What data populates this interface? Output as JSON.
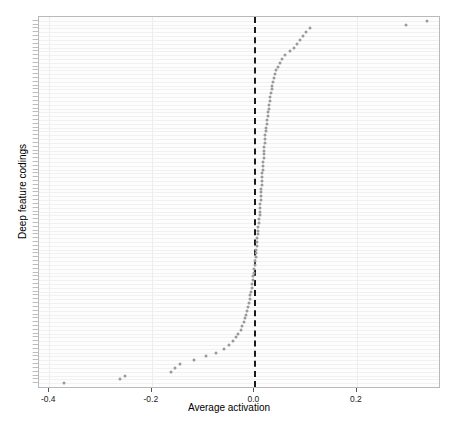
{
  "chart_data": {
    "type": "scatter",
    "title": "",
    "xlabel": "Average activation",
    "ylabel": "Deep feature codings",
    "xlim": [
      -0.42,
      0.36
    ],
    "ylim": [
      0,
      94
    ],
    "grid": true,
    "legend": "none",
    "annotations": [
      {
        "type": "vline",
        "x": 0.0,
        "style": "dashed",
        "color": "#1a1a1a"
      }
    ],
    "xticks": [
      -0.4,
      -0.2,
      0.0,
      0.2
    ],
    "xticklabels": [
      "-0.4",
      "-0.2",
      "0.0",
      "0.2"
    ],
    "marker": {
      "shape": "circle",
      "color": "#9a9a9a",
      "size": 3
    },
    "categories": [
      "C-93",
      "C-92",
      "C-91",
      "C-90",
      "C-89",
      "C-88",
      "C-87",
      "C-86",
      "C-85",
      "C-84",
      "C-83",
      "C-82",
      "C-81",
      "C-80",
      "C-79",
      "C-78",
      "C-77",
      "C-76",
      "C-75",
      "C-74",
      "C-73",
      "C-72",
      "C-71",
      "C-70",
      "C-69",
      "C-68",
      "C-67",
      "C-66",
      "C-65",
      "C-64",
      "C-63",
      "C-62",
      "C-61",
      "C-60",
      "C-59",
      "C-58",
      "C-57",
      "C-56",
      "C-55",
      "C-54",
      "C-53",
      "C-52",
      "C-51",
      "C-50",
      "C-49",
      "C-48",
      "C-47",
      "C-46",
      "C-45",
      "C-44",
      "C-43",
      "C-42",
      "C-41",
      "C-40",
      "C-39",
      "C-38",
      "C-37",
      "C-36",
      "C-35",
      "C-34",
      "C-33",
      "C-32",
      "C-31",
      "C-30",
      "C-29",
      "C-28",
      "C-27",
      "C-26",
      "C-25",
      "C-24",
      "C-23",
      "C-22",
      "C-21",
      "C-20",
      "C-19",
      "C-18",
      "C-17",
      "C-16",
      "C-15",
      "C-14",
      "C-13",
      "C-12",
      "C-11",
      "C-10",
      "C-09",
      "C-08",
      "C-07",
      "C-06",
      "C-05",
      "C-04",
      "C-03",
      "C-02",
      "C-01"
    ],
    "values": [
      0.337,
      0.295,
      0.108,
      0.101,
      0.094,
      0.089,
      0.084,
      0.078,
      0.069,
      0.06,
      0.054,
      0.049,
      0.046,
      0.043,
      0.041,
      0.039,
      0.037,
      0.035,
      0.034,
      0.032,
      0.031,
      0.03,
      0.029,
      0.028,
      0.027,
      0.026,
      0.025,
      0.024,
      0.023,
      0.022,
      0.021,
      0.021,
      0.02,
      0.019,
      0.019,
      0.018,
      0.018,
      0.017,
      0.016,
      0.016,
      0.015,
      0.015,
      0.014,
      0.014,
      0.013,
      0.013,
      0.012,
      0.012,
      0.011,
      0.011,
      0.01,
      0.01,
      0.009,
      0.009,
      0.008,
      0.008,
      0.007,
      0.006,
      0.006,
      0.005,
      0.004,
      0.004,
      0.003,
      0.002,
      0.001,
      0.0,
      -0.001,
      -0.002,
      -0.003,
      -0.004,
      -0.005,
      -0.006,
      -0.008,
      -0.009,
      -0.011,
      -0.013,
      -0.015,
      -0.017,
      -0.019,
      -0.021,
      -0.024,
      -0.027,
      -0.031,
      -0.036,
      -0.042,
      -0.05,
      -0.06,
      -0.075,
      -0.095,
      -0.118,
      -0.145,
      -0.155,
      -0.163
    ],
    "extra_low_values": [
      -0.253,
      -0.263,
      -0.372
    ]
  },
  "axes": {
    "x_title": "Average activation",
    "y_title": "Deep feature codings"
  }
}
